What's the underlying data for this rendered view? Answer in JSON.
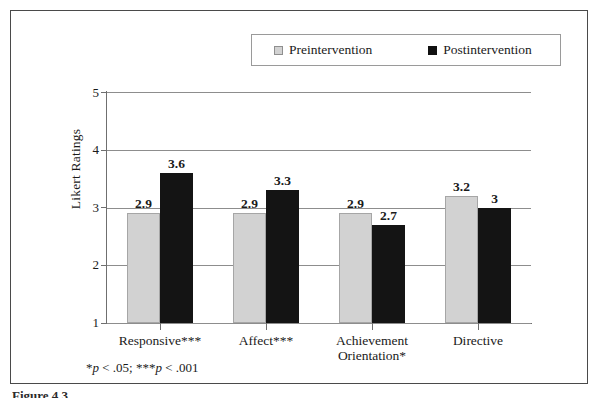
{
  "figure": {
    "border_color": "#4a4a4a",
    "background": "#ffffff",
    "caption_partial": "Figure 4.3"
  },
  "legend": {
    "position": "top-center",
    "entries": [
      {
        "label": "Preintervention",
        "swatch": "legend-swatch-gray",
        "color": "#d2d2d2"
      },
      {
        "label": "Postintervention",
        "swatch": "legend-swatch-black",
        "color": "#141414"
      }
    ]
  },
  "footnote": {
    "prefix": "*",
    "p1": "p",
    "mid": " < .05; ***",
    "p2": "p",
    "suffix": " < .001",
    "full": "*p < .05; ***p < .001"
  },
  "axes": {
    "y_title": "Likert Ratings",
    "y_ticks": [
      "5",
      "4",
      "3",
      "2",
      "1"
    ],
    "y_min": 1,
    "y_max": 5
  },
  "chart_data": {
    "type": "bar",
    "title": "",
    "subtitle": "",
    "xlabel": "",
    "ylabel": "Likert Ratings",
    "ylim": [
      1,
      5
    ],
    "yticks": [
      1,
      2,
      3,
      4,
      5
    ],
    "grid": true,
    "legend_position": "top-center",
    "categories": [
      "Responsive***",
      "Affect***",
      "Achievement Orientation*",
      "Directive"
    ],
    "category_lines": [
      [
        "Responsive***"
      ],
      [
        "Affect***"
      ],
      [
        "Achievement",
        "Orientation*"
      ],
      [
        "Directive"
      ]
    ],
    "series": [
      {
        "name": "Preintervention",
        "color": "#d2d2d2",
        "values": [
          2.9,
          2.9,
          2.9,
          3.2
        ],
        "labels": [
          "2.9",
          "2.9",
          "2.9",
          "3.2"
        ]
      },
      {
        "name": "Postintervention",
        "color": "#141414",
        "values": [
          3.6,
          3.3,
          2.7,
          3.0
        ],
        "labels": [
          "3.6",
          "3.3",
          "2.7",
          "3"
        ]
      }
    ],
    "annotations": [
      "*p < .05; ***p < .001"
    ]
  }
}
